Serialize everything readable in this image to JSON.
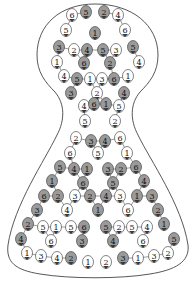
{
  "diagram": {
    "type": "numbered-tile-puzzle",
    "shape": "flask",
    "colors": {
      "background": "#ffffff",
      "outline": "#444444",
      "white_cell": "#ffffff",
      "gray_cell": "#9a9a9a",
      "dark_tip": "#3a3a3a",
      "text": "#111111"
    },
    "cells": [
      {
        "x": 72,
        "y": 15,
        "n": "6",
        "fill": "white"
      },
      {
        "x": 86,
        "y": 12,
        "n": "5",
        "fill": "gray"
      },
      {
        "x": 104,
        "y": 12,
        "n": "2",
        "fill": "gray"
      },
      {
        "x": 118,
        "y": 15,
        "n": "4",
        "fill": "white"
      },
      {
        "x": 66,
        "y": 30,
        "n": "5",
        "fill": "white"
      },
      {
        "x": 95,
        "y": 33,
        "n": "1",
        "fill": "gray"
      },
      {
        "x": 125,
        "y": 30,
        "n": "6",
        "fill": "white"
      },
      {
        "x": 59,
        "y": 47,
        "n": "3",
        "fill": "gray"
      },
      {
        "x": 74,
        "y": 50,
        "n": "2",
        "fill": "white"
      },
      {
        "x": 87,
        "y": 50,
        "n": "4",
        "fill": "gray"
      },
      {
        "x": 103,
        "y": 50,
        "n": "5",
        "fill": "gray"
      },
      {
        "x": 116,
        "y": 50,
        "n": "3",
        "fill": "white"
      },
      {
        "x": 133,
        "y": 47,
        "n": "5",
        "fill": "gray"
      },
      {
        "x": 57,
        "y": 62,
        "n": "1",
        "fill": "white"
      },
      {
        "x": 84,
        "y": 63,
        "n": "6",
        "fill": "gray"
      },
      {
        "x": 110,
        "y": 63,
        "n": "2",
        "fill": "gray"
      },
      {
        "x": 139,
        "y": 62,
        "n": "4",
        "fill": "white"
      },
      {
        "x": 64,
        "y": 76,
        "n": "4",
        "fill": "white"
      },
      {
        "x": 77,
        "y": 79,
        "n": "5",
        "fill": "gray"
      },
      {
        "x": 90,
        "y": 79,
        "n": "1",
        "fill": "white"
      },
      {
        "x": 102,
        "y": 79,
        "n": "3",
        "fill": "white"
      },
      {
        "x": 114,
        "y": 79,
        "n": "6",
        "fill": "gray"
      },
      {
        "x": 128,
        "y": 76,
        "n": "1",
        "fill": "white"
      },
      {
        "x": 71,
        "y": 93,
        "n": "3",
        "fill": "gray"
      },
      {
        "x": 97,
        "y": 93,
        "n": "2",
        "fill": "white"
      },
      {
        "x": 124,
        "y": 93,
        "n": "4",
        "fill": "gray"
      },
      {
        "x": 84,
        "y": 106,
        "n": "4",
        "fill": "white"
      },
      {
        "x": 94,
        "y": 104,
        "n": "6",
        "fill": "gray"
      },
      {
        "x": 106,
        "y": 104,
        "n": "1",
        "fill": "gray"
      },
      {
        "x": 119,
        "y": 106,
        "n": "5",
        "fill": "white"
      },
      {
        "x": 85,
        "y": 121,
        "n": "5",
        "fill": "white"
      },
      {
        "x": 115,
        "y": 121,
        "n": "2",
        "fill": "white"
      },
      {
        "x": 76,
        "y": 138,
        "n": "2",
        "fill": "white"
      },
      {
        "x": 91,
        "y": 141,
        "n": "3",
        "fill": "gray"
      },
      {
        "x": 105,
        "y": 141,
        "n": "4",
        "fill": "gray"
      },
      {
        "x": 120,
        "y": 138,
        "n": "6",
        "fill": "white"
      },
      {
        "x": 70,
        "y": 153,
        "n": "6",
        "fill": "white"
      },
      {
        "x": 98,
        "y": 153,
        "n": "5",
        "fill": "white"
      },
      {
        "x": 127,
        "y": 153,
        "n": "1",
        "fill": "white"
      },
      {
        "x": 60,
        "y": 167,
        "n": "5",
        "fill": "gray"
      },
      {
        "x": 74,
        "y": 169,
        "n": "4",
        "fill": "gray"
      },
      {
        "x": 87,
        "y": 169,
        "n": "1",
        "fill": "gray"
      },
      {
        "x": 108,
        "y": 169,
        "n": "3",
        "fill": "gray"
      },
      {
        "x": 121,
        "y": 169,
        "n": "2",
        "fill": "gray"
      },
      {
        "x": 136,
        "y": 167,
        "n": "6",
        "fill": "gray"
      },
      {
        "x": 52,
        "y": 181,
        "n": "1",
        "fill": "gray"
      },
      {
        "x": 83,
        "y": 183,
        "n": "6",
        "fill": "gray"
      },
      {
        "x": 113,
        "y": 183,
        "n": "5",
        "fill": "gray"
      },
      {
        "x": 144,
        "y": 181,
        "n": "4",
        "fill": "gray"
      },
      {
        "x": 44,
        "y": 196,
        "n": "6",
        "fill": "gray"
      },
      {
        "x": 58,
        "y": 196,
        "n": "2",
        "fill": "gray"
      },
      {
        "x": 75,
        "y": 196,
        "n": "3",
        "fill": "white"
      },
      {
        "x": 90,
        "y": 196,
        "n": "2",
        "fill": "gray"
      },
      {
        "x": 106,
        "y": 196,
        "n": "4",
        "fill": "gray"
      },
      {
        "x": 120,
        "y": 196,
        "n": "3",
        "fill": "white"
      },
      {
        "x": 137,
        "y": 196,
        "n": "1",
        "fill": "gray"
      },
      {
        "x": 152,
        "y": 196,
        "n": "3",
        "fill": "gray"
      },
      {
        "x": 37,
        "y": 210,
        "n": "3",
        "fill": "gray"
      },
      {
        "x": 67,
        "y": 210,
        "n": "4",
        "fill": "white"
      },
      {
        "x": 98,
        "y": 210,
        "n": "1",
        "fill": "gray"
      },
      {
        "x": 128,
        "y": 210,
        "n": "6",
        "fill": "white"
      },
      {
        "x": 158,
        "y": 210,
        "n": "2",
        "fill": "gray"
      },
      {
        "x": 28,
        "y": 224,
        "n": "2",
        "fill": "gray"
      },
      {
        "x": 43,
        "y": 227,
        "n": "5",
        "fill": "white"
      },
      {
        "x": 56,
        "y": 227,
        "n": "1",
        "fill": "white"
      },
      {
        "x": 71,
        "y": 227,
        "n": "5",
        "fill": "white"
      },
      {
        "x": 84,
        "y": 227,
        "n": "6",
        "fill": "gray"
      },
      {
        "x": 106,
        "y": 227,
        "n": "5",
        "fill": "gray"
      },
      {
        "x": 119,
        "y": 227,
        "n": "2",
        "fill": "white"
      },
      {
        "x": 132,
        "y": 227,
        "n": "5",
        "fill": "white"
      },
      {
        "x": 147,
        "y": 227,
        "n": "4",
        "fill": "white"
      },
      {
        "x": 164,
        "y": 224,
        "n": "1",
        "fill": "gray"
      },
      {
        "x": 21,
        "y": 239,
        "n": "4",
        "fill": "gray"
      },
      {
        "x": 51,
        "y": 241,
        "n": "6",
        "fill": "white"
      },
      {
        "x": 82,
        "y": 241,
        "n": "3",
        "fill": "gray"
      },
      {
        "x": 113,
        "y": 241,
        "n": "4",
        "fill": "gray"
      },
      {
        "x": 143,
        "y": 241,
        "n": "6",
        "fill": "white"
      },
      {
        "x": 174,
        "y": 239,
        "n": "5",
        "fill": "gray"
      },
      {
        "x": 27,
        "y": 253,
        "n": "1",
        "fill": "white"
      },
      {
        "x": 41,
        "y": 256,
        "n": "3",
        "fill": "white"
      },
      {
        "x": 57,
        "y": 258,
        "n": "4",
        "fill": "white"
      },
      {
        "x": 71,
        "y": 258,
        "n": "2",
        "fill": "gray"
      },
      {
        "x": 88,
        "y": 262,
        "n": "1",
        "fill": "white"
      },
      {
        "x": 106,
        "y": 262,
        "n": "2",
        "fill": "white"
      },
      {
        "x": 123,
        "y": 258,
        "n": "3",
        "fill": "gray"
      },
      {
        "x": 138,
        "y": 258,
        "n": "1",
        "fill": "white"
      },
      {
        "x": 154,
        "y": 256,
        "n": "3",
        "fill": "white"
      },
      {
        "x": 168,
        "y": 253,
        "n": "2",
        "fill": "white"
      }
    ]
  }
}
